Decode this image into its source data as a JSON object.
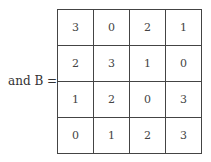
{
  "label": "and  B =",
  "matrix": {
    "rows": [
      [
        "3",
        "0",
        "2",
        "1"
      ],
      [
        "2",
        "3",
        "1",
        "0"
      ],
      [
        "1",
        "2",
        "0",
        "3"
      ],
      [
        "0",
        "1",
        "2",
        "3"
      ]
    ]
  }
}
